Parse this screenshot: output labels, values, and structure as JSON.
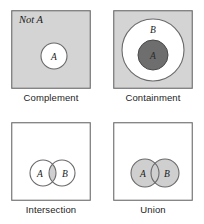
{
  "figure": {
    "type": "venn-diagram-set",
    "panels": [
      {
        "id": "complement",
        "caption": "Complement",
        "box_fill": "#d4d4d4",
        "box_stroke": "#6a6a6a",
        "inner_label": "Not A",
        "inner_label_style": "italic",
        "circles": [
          {
            "label": "A",
            "fill": "#ffffff",
            "stroke": "#6a6a6a",
            "cx": 43,
            "cy": 46,
            "r": 13
          }
        ]
      },
      {
        "id": "containment",
        "caption": "Containment",
        "box_fill": "#d4d4d4",
        "box_stroke": "#6a6a6a",
        "circles": [
          {
            "label": "B",
            "fill": "#ffffff",
            "stroke": "#6a6a6a",
            "cx": 40,
            "cy": 40,
            "r": 31
          },
          {
            "label": "A",
            "fill": "#6e6e6e",
            "stroke": "#4a4a4a",
            "cx": 40,
            "cy": 45,
            "r": 15
          }
        ]
      },
      {
        "id": "intersection",
        "caption": "Intersection",
        "box_fill": "#ffffff",
        "box_stroke": "#6a6a6a",
        "shaded_region": "overlap-lens",
        "shade_fill": "#cfcfcf",
        "circles": [
          {
            "label": "A",
            "fill": "none",
            "stroke": "#6a6a6a",
            "cx": 32,
            "cy": 51,
            "r": 13
          },
          {
            "label": "B",
            "fill": "none",
            "stroke": "#6a6a6a",
            "cx": 51,
            "cy": 51,
            "r": 13
          }
        ]
      },
      {
        "id": "union",
        "caption": "Union",
        "box_fill": "#ffffff",
        "box_stroke": "#6a6a6a",
        "shaded_region": "both-circles",
        "shade_fill": "#cfcfcf",
        "circles": [
          {
            "label": "A",
            "fill": "#cfcfcf",
            "stroke": "#6a6a6a",
            "cx": 32,
            "cy": 51,
            "r": 14
          },
          {
            "label": "B",
            "fill": "#cfcfcf",
            "stroke": "#6a6a6a",
            "cx": 52,
            "cy": 51,
            "r": 14
          }
        ]
      }
    ]
  }
}
